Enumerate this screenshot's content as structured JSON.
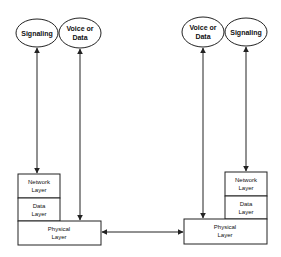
{
  "diagram": {
    "left_stack": {
      "ellipses": [
        {
          "id": "signaling",
          "label_lines": [
            "Signaling"
          ]
        },
        {
          "id": "voice-data",
          "label_lines": [
            "Voice or",
            "Data"
          ]
        }
      ],
      "layers": {
        "network": [
          "Network",
          "Layer"
        ],
        "data": [
          "Data",
          "Layer"
        ],
        "physical": [
          "Physical",
          "Layer"
        ]
      }
    },
    "right_stack": {
      "ellipses": [
        {
          "id": "voice-data",
          "label_lines": [
            "Voice or",
            "Data"
          ]
        },
        {
          "id": "signaling",
          "label_lines": [
            "Signaling"
          ]
        }
      ],
      "layers": {
        "network": [
          "Network",
          "Layer"
        ],
        "data": [
          "Data",
          "Layer"
        ],
        "physical": [
          "Physical",
          "Layer"
        ]
      }
    },
    "connections": [
      {
        "from": "left.signaling",
        "to": "left.network",
        "type": "bidirectional"
      },
      {
        "from": "left.voice-data",
        "to": "left.physical",
        "type": "bidirectional"
      },
      {
        "from": "left.physical",
        "to": "right.physical",
        "type": "bidirectional"
      },
      {
        "from": "right.voice-data",
        "to": "right.physical",
        "type": "bidirectional"
      },
      {
        "from": "right.signaling",
        "to": "right.network",
        "type": "bidirectional"
      }
    ],
    "colors": {
      "stroke": "#222222",
      "background": "#ffffff"
    }
  }
}
